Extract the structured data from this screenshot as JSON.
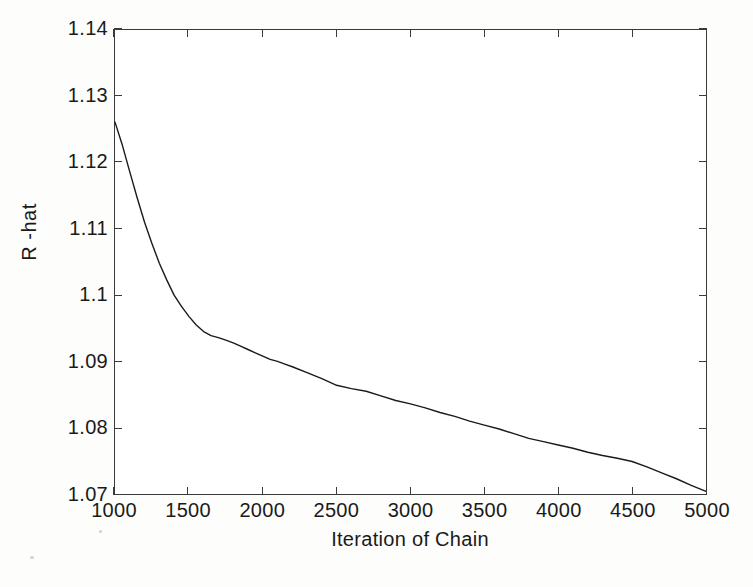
{
  "figure": {
    "width": 753,
    "height": 587,
    "background": "#ffffff",
    "line_color": "#1a1a1a",
    "axis_color": "#3a3a3a"
  },
  "chart_data": {
    "type": "line",
    "title": "",
    "xlabel": "Iteration of Chain",
    "ylabel": "R -hat",
    "xlim": [
      1000,
      5000
    ],
    "ylim": [
      1.07,
      1.14
    ],
    "xticks": [
      1000,
      1500,
      2000,
      2500,
      3000,
      3500,
      4000,
      4500,
      5000
    ],
    "xticklabels": [
      "1000",
      "1500",
      "2000",
      "2500",
      "3000",
      "3500",
      "4000",
      "4500",
      "5000"
    ],
    "yticks": [
      1.07,
      1.08,
      1.09,
      1.1,
      1.11,
      1.12,
      1.13,
      1.14
    ],
    "yticklabels": [
      "1.07",
      "1.08",
      "1.09",
      "1.1",
      "1.11",
      "1.12",
      "1.13",
      "1.14"
    ],
    "grid": false,
    "legend": false,
    "series": [
      {
        "name": "R-hat",
        "color": "#1a1a1a",
        "linewidth": 1.4,
        "x": [
          1000,
          1050,
          1100,
          1150,
          1200,
          1250,
          1300,
          1350,
          1400,
          1450,
          1500,
          1550,
          1600,
          1650,
          1700,
          1750,
          1800,
          1850,
          1900,
          1950,
          2000,
          2050,
          2100,
          2150,
          2200,
          2300,
          2400,
          2500,
          2600,
          2700,
          2800,
          2900,
          3000,
          3100,
          3200,
          3300,
          3400,
          3500,
          3600,
          3700,
          3800,
          3900,
          4000,
          4100,
          4200,
          4300,
          4400,
          4500,
          4600,
          4700,
          4800,
          4900,
          5000
        ],
        "y": [
          1.1261,
          1.1226,
          1.1186,
          1.1147,
          1.111,
          1.1078,
          1.1048,
          1.1023,
          1.1,
          1.0983,
          1.0968,
          1.0955,
          1.0945,
          1.0939,
          1.0936,
          1.0932,
          1.0928,
          1.0923,
          1.0918,
          1.0913,
          1.0908,
          1.0903,
          1.09,
          1.0896,
          1.0892,
          1.0883,
          1.0874,
          1.0864,
          1.0859,
          1.0855,
          1.0848,
          1.0841,
          1.0836,
          1.083,
          1.0823,
          1.0817,
          1.081,
          1.0804,
          1.0798,
          1.0791,
          1.0784,
          1.0779,
          1.0774,
          1.0769,
          1.0763,
          1.0758,
          1.0754,
          1.0749,
          1.0741,
          1.0732,
          1.0723,
          1.0713,
          1.0704
        ]
      }
    ]
  }
}
